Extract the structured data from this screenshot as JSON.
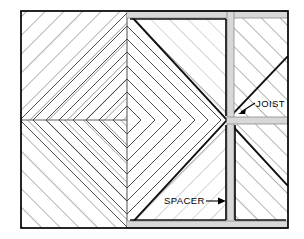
{
  "diagram": {
    "type": "architectural-construction-detail",
    "frame": {
      "x": 21,
      "y": 11,
      "width": 267,
      "height": 217,
      "stroke": "#000000",
      "stroke_width": 1.6,
      "fill": "#ffffff"
    },
    "center": {
      "x": 227,
      "y": 120
    },
    "pattern_center": {
      "x": 127,
      "y": 120
    },
    "vertical_divider_x": 127,
    "colors": {
      "outline": "#000000",
      "hatch_line": "#5a5a5a",
      "heavy_line": "#111111",
      "spacer_fill": "#d8d8d8",
      "spacer_edge": "#8c8c8c",
      "background": "#ffffff",
      "label_text": "#000000"
    },
    "labels": [
      {
        "id": "joist",
        "text": "JOIST",
        "x": 257,
        "y": 106,
        "anchor": "start",
        "leader": {
          "from_x": 255,
          "from_y": 104,
          "to_x": 240,
          "to_y": 113
        },
        "arrow": {
          "x": 241,
          "y": 112,
          "rotation": 150
        }
      },
      {
        "id": "spacer",
        "text": "SPACER",
        "x": 165,
        "y": 204,
        "anchor": "start",
        "leader": {
          "from_x": 208,
          "from_y": 201,
          "to_x": 224,
          "to_y": 201
        },
        "arrow": {
          "x": 224,
          "y": 201,
          "rotation": 0
        }
      }
    ],
    "regions": [
      {
        "id": "left-chevron-field",
        "description": "concentric diamond / chevron board pattern",
        "hatch_angle_deg": 45
      },
      {
        "id": "upper-right-pinwheel",
        "description": "pinwheel quadrant with 45 degree boards"
      },
      {
        "id": "lower-right-pinwheel",
        "description": "pinwheel quadrant with 45 degree boards"
      },
      {
        "id": "top-right-hatch",
        "description": "diagonal hatched decking field",
        "hatch_angle_deg": -45
      },
      {
        "id": "bottom-right-hatch",
        "description": "diagonal hatched decking field",
        "hatch_angle_deg": -45
      }
    ],
    "spacer_bands": [
      {
        "id": "top-band",
        "orientation": "horizontal",
        "x": 127,
        "y": 11,
        "length": 161,
        "thickness": 7
      },
      {
        "id": "center-vertical-band",
        "orientation": "vertical",
        "x": 227,
        "y": 11,
        "length": 217,
        "thickness": 7
      },
      {
        "id": "joist-band",
        "orientation": "horizontal",
        "x": 227,
        "y": 117,
        "length": 61,
        "thickness": 7
      },
      {
        "id": "bottom-band",
        "orientation": "horizontal",
        "x": 127,
        "y": 221,
        "length": 161,
        "thickness": 7
      }
    ]
  }
}
